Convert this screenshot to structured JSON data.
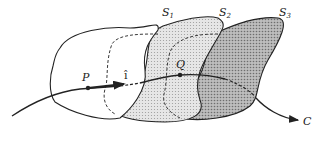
{
  "diagram": {
    "surfaces": [
      {
        "name": "S",
        "sub": "1",
        "fill": "#ffffff",
        "style": "outline"
      },
      {
        "name": "S",
        "sub": "2",
        "fill": "#d9d9d9",
        "style": "light-stipple"
      },
      {
        "name": "S",
        "sub": "3",
        "fill": "#a8a8a8",
        "style": "dark-stipple"
      }
    ],
    "points": [
      {
        "label": "P"
      },
      {
        "label": "Q"
      }
    ],
    "vector_label": "î",
    "curve_label": "C",
    "colors": {
      "ink": "#222222",
      "s2_fill": "#d9d9d9",
      "s3_fill": "#a8a8a8"
    }
  }
}
